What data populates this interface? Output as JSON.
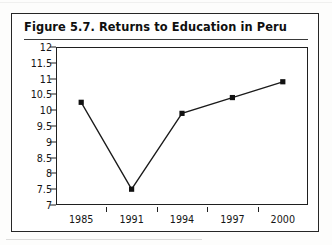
{
  "figure": {
    "title": "Figure 5.7.  Returns to Education in Peru"
  },
  "chart_data": {
    "type": "line",
    "title": "Figure 5.7.  Returns to Education in Peru",
    "xlabel": "",
    "ylabel": "",
    "categories": [
      "1985",
      "1991",
      "1994",
      "1997",
      "2000"
    ],
    "values": [
      10.25,
      7.5,
      9.9,
      10.4,
      10.9
    ],
    "series": [
      {
        "name": "Returns to Education",
        "values": [
          10.25,
          7.5,
          9.9,
          10.4,
          10.9
        ]
      }
    ],
    "ylim": [
      7,
      12
    ],
    "ytick_labels": [
      "12",
      "11.5",
      "11",
      "10.5",
      "10",
      "9.5",
      "9",
      "8.5",
      "8",
      "7.5",
      "7"
    ],
    "ytick_values": [
      12,
      11.5,
      11,
      10.5,
      10,
      9.5,
      9,
      8.5,
      8,
      7.5,
      7
    ],
    "xtick_labels": [
      "1985",
      "1991",
      "1994",
      "1997",
      "2000"
    ],
    "grid": false,
    "legend": false,
    "marker": "square",
    "line_color": "#1a1a1a",
    "marker_color": "#111111"
  }
}
